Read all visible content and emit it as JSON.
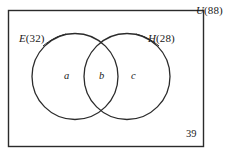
{
  "figure": {
    "type": "venn-diagram-two-set",
    "stroke_color": "#2b2b2b",
    "text_color": "#1a1a1a",
    "background_color": "#ffffff"
  },
  "universe": {
    "symbol": "U",
    "count_text": "(88)",
    "full_label": "U(88)",
    "total": 88
  },
  "sets": [
    {
      "id": "E",
      "symbol": "E",
      "count_text": "(32)",
      "full_label": "E(32)",
      "total": 32,
      "position": "left"
    },
    {
      "id": "H",
      "symbol": "H",
      "count_text": "(28)",
      "full_label": "H(28)",
      "total": 28,
      "position": "right"
    }
  ],
  "regions": [
    {
      "id": "a",
      "label": "a",
      "description": "E only"
    },
    {
      "id": "b",
      "label": "b",
      "description": "E intersect H"
    },
    {
      "id": "c",
      "label": "c",
      "description": "H only"
    }
  ],
  "outside": {
    "label": "39",
    "value": 39,
    "description": "neither E nor H"
  }
}
